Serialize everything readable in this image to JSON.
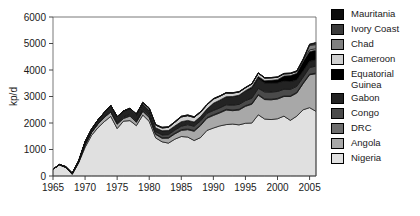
{
  "chart": {
    "ylabel": "kp/d",
    "xlabel": "",
    "title": "",
    "x_ticks": [
      "1965",
      "1970",
      "1975",
      "1980",
      "1985",
      "1990",
      "1995",
      "2000",
      "2005"
    ],
    "y_ticks": [
      "0",
      "1000",
      "2000",
      "3000",
      "4000",
      "5000",
      "6000"
    ]
  },
  "legend": {
    "position": "right",
    "items": [
      {
        "label": "Mauritania",
        "color": "#0d0d0d"
      },
      {
        "label": "Ivory Coast",
        "color": "#3b3b3b"
      },
      {
        "label": "Chad",
        "color": "#808080"
      },
      {
        "label": "Cameroon",
        "color": "#cfcfcf"
      },
      {
        "label": "Equatorial\nGuinea",
        "color": "#000000"
      },
      {
        "label": "Gabon",
        "color": "#232323"
      },
      {
        "label": "Congo",
        "color": "#4a4a4a"
      },
      {
        "label": "DRC",
        "color": "#6e6e6e"
      },
      {
        "label": "Angola",
        "color": "#a8a8a8"
      },
      {
        "label": "Nigeria",
        "color": "#e0e0e0"
      }
    ]
  },
  "chart_data": {
    "type": "area",
    "stacked": true,
    "title": "",
    "xlabel": "",
    "ylabel": "kp/d",
    "xlim": [
      1965,
      2006
    ],
    "ylim": [
      0,
      6000
    ],
    "grid": false,
    "legend_position": "right",
    "x": [
      1965,
      1966,
      1967,
      1968,
      1969,
      1970,
      1971,
      1972,
      1973,
      1974,
      1975,
      1976,
      1977,
      1978,
      1979,
      1980,
      1981,
      1982,
      1983,
      1984,
      1985,
      1986,
      1987,
      1988,
      1989,
      1990,
      1991,
      1992,
      1993,
      1994,
      1995,
      1996,
      1997,
      1998,
      1999,
      2000,
      2001,
      2002,
      2003,
      2004,
      2005,
      2006
    ],
    "series": [
      {
        "name": "Nigeria",
        "color": "#e0e0e0",
        "values": [
          255,
          420,
          320,
          60,
          500,
          1080,
          1530,
          1820,
          2050,
          2250,
          1790,
          2070,
          2090,
          1900,
          2300,
          2060,
          1440,
          1290,
          1240,
          1390,
          1490,
          1470,
          1340,
          1450,
          1720,
          1810,
          1890,
          1940,
          1960,
          1930,
          1990,
          2000,
          2310,
          2150,
          2130,
          2160,
          2260,
          2100,
          2260,
          2500,
          2580,
          2440
        ]
      },
      {
        "name": "Angola",
        "color": "#a8a8a8",
        "values": [
          0,
          5,
          10,
          20,
          30,
          100,
          110,
          140,
          160,
          170,
          165,
          100,
          170,
          130,
          140,
          150,
          130,
          135,
          190,
          200,
          230,
          280,
          350,
          450,
          460,
          475,
          490,
          550,
          505,
          560,
          640,
          710,
          740,
          735,
          745,
          745,
          740,
          900,
          870,
          990,
          1240,
          1420
        ]
      },
      {
        "name": "DRC",
        "color": "#6e6e6e",
        "values": [
          0,
          0,
          0,
          0,
          0,
          0,
          0,
          0,
          0,
          0,
          18,
          24,
          24,
          22,
          22,
          22,
          22,
          21,
          21,
          25,
          29,
          29,
          28,
          27,
          27,
          28,
          28,
          28,
          28,
          28,
          26,
          26,
          25,
          25,
          24,
          24,
          24,
          24,
          24,
          24,
          24,
          24
        ]
      },
      {
        "name": "Congo",
        "color": "#4a4a4a",
        "values": [
          0,
          0,
          0,
          0,
          0,
          5,
          8,
          30,
          38,
          40,
          40,
          40,
          37,
          45,
          50,
          62,
          80,
          105,
          110,
          120,
          130,
          160,
          160,
          155,
          160,
          160,
          160,
          170,
          180,
          185,
          190,
          200,
          230,
          265,
          270,
          260,
          250,
          245,
          230,
          215,
          250,
          265
        ]
      },
      {
        "name": "Gabon",
        "color": "#232323",
        "values": [
          0,
          10,
          20,
          30,
          40,
          105,
          115,
          125,
          150,
          200,
          225,
          220,
          220,
          205,
          205,
          175,
          150,
          155,
          155,
          155,
          170,
          160,
          160,
          160,
          160,
          270,
          295,
          300,
          320,
          335,
          355,
          365,
          370,
          335,
          340,
          325,
          310,
          295,
          240,
          235,
          235,
          235
        ]
      },
      {
        "name": "Equatorial Guinea",
        "color": "#000000",
        "values": [
          0,
          0,
          0,
          0,
          0,
          0,
          0,
          0,
          0,
          0,
          0,
          0,
          0,
          0,
          0,
          0,
          0,
          0,
          0,
          0,
          0,
          0,
          0,
          0,
          0,
          0,
          0,
          5,
          7,
          10,
          18,
          60,
          80,
          85,
          100,
          120,
          190,
          225,
          250,
          355,
          370,
          365
        ]
      },
      {
        "name": "Cameroon",
        "color": "#cfcfcf",
        "values": [
          0,
          0,
          0,
          0,
          0,
          0,
          0,
          0,
          0,
          0,
          0,
          0,
          15,
          35,
          55,
          80,
          100,
          110,
          120,
          140,
          180,
          180,
          175,
          165,
          155,
          160,
          145,
          140,
          130,
          120,
          110,
          110,
          125,
          105,
          95,
          90,
          80,
          75,
          70,
          65,
          60,
          55
        ]
      },
      {
        "name": "Chad",
        "color": "#808080",
        "values": [
          0,
          0,
          0,
          0,
          0,
          0,
          0,
          0,
          0,
          0,
          0,
          0,
          0,
          0,
          0,
          0,
          0,
          0,
          0,
          0,
          0,
          0,
          0,
          0,
          0,
          0,
          0,
          0,
          0,
          0,
          0,
          0,
          0,
          0,
          0,
          0,
          0,
          0,
          0,
          0,
          175,
          155
        ]
      },
      {
        "name": "Ivory Coast",
        "color": "#3b3b3b",
        "values": [
          0,
          0,
          0,
          0,
          0,
          0,
          0,
          0,
          0,
          0,
          0,
          0,
          0,
          0,
          0,
          18,
          20,
          22,
          22,
          22,
          25,
          25,
          22,
          20,
          18,
          16,
          15,
          14,
          13,
          12,
          12,
          12,
          12,
          12,
          12,
          14,
          16,
          18,
          22,
          26,
          38,
          55
        ]
      },
      {
        "name": "Mauritania",
        "color": "#0d0d0d",
        "values": [
          0,
          0,
          0,
          0,
          0,
          0,
          0,
          0,
          0,
          0,
          0,
          0,
          0,
          0,
          0,
          0,
          0,
          0,
          0,
          0,
          0,
          0,
          0,
          0,
          0,
          0,
          0,
          0,
          0,
          0,
          0,
          0,
          0,
          0,
          0,
          0,
          0,
          0,
          0,
          0,
          0,
          30
        ]
      }
    ]
  }
}
